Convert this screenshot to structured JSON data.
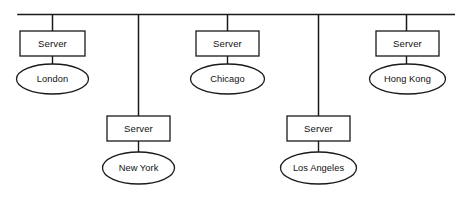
{
  "diagram": {
    "type": "network-topology-bus",
    "canvas": {
      "width": 455,
      "height": 203
    },
    "colors": {
      "background": "#ffffff",
      "stroke": "#1a1a1a",
      "text": "#111111",
      "fill": "#ffffff"
    },
    "backbone": {
      "name": "network-backbone",
      "orientation": "horizontal",
      "x1": 18,
      "x2": 455,
      "y": 14
    },
    "nodes": [
      {
        "id": "london",
        "server_label": "Server",
        "site_label": "London",
        "row": "top",
        "drop_x": 52,
        "box": {
          "x": 20,
          "y": 31,
          "w": 65,
          "h": 25
        },
        "ellipse": {
          "cx": 52.5,
          "cy": 79,
          "rx": 36,
          "ry": 15
        }
      },
      {
        "id": "new-york",
        "server_label": "Server",
        "site_label": "New York",
        "row": "bottom",
        "drop_x": 138,
        "box": {
          "x": 107,
          "y": 116,
          "w": 63,
          "h": 25
        },
        "ellipse": {
          "cx": 138.5,
          "cy": 168,
          "rx": 36,
          "ry": 16
        }
      },
      {
        "id": "chicago",
        "server_label": "Server",
        "site_label": "Chicago",
        "row": "top",
        "drop_x": 227,
        "box": {
          "x": 196,
          "y": 31,
          "w": 63,
          "h": 25
        },
        "ellipse": {
          "cx": 227.5,
          "cy": 79,
          "rx": 37,
          "ry": 15
        }
      },
      {
        "id": "los-angeles",
        "server_label": "Server",
        "site_label": "Los Angeles",
        "row": "bottom",
        "drop_x": 318,
        "box": {
          "x": 287,
          "y": 116,
          "w": 63,
          "h": 25
        },
        "ellipse": {
          "cx": 318.5,
          "cy": 168,
          "rx": 38,
          "ry": 16
        }
      },
      {
        "id": "hong-kong",
        "server_label": "Server",
        "site_label": "Hong Kong",
        "row": "top",
        "drop_x": 406,
        "box": {
          "x": 376,
          "y": 31,
          "w": 63,
          "h": 25
        },
        "ellipse": {
          "cx": 407.5,
          "cy": 79,
          "rx": 38,
          "ry": 15
        }
      }
    ]
  }
}
